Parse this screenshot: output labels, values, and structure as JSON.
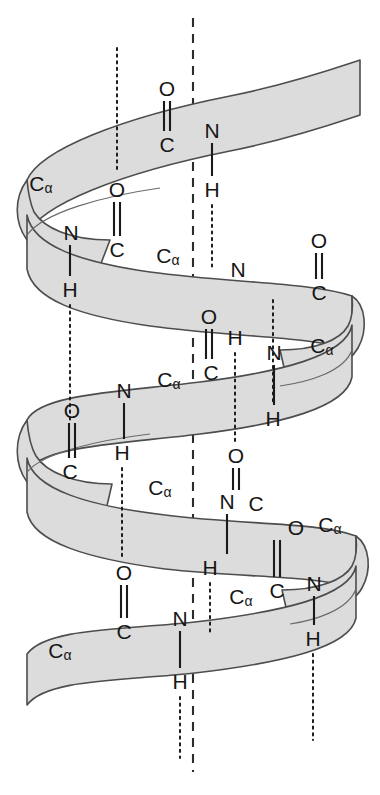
{
  "figure": {
    "width": 380,
    "height": 795,
    "background_color": "#ffffff",
    "ribbon_fill_color": "#dcdcdc",
    "ribbon_stroke_color": "#4d4d4d",
    "label_color": "#161616",
    "bond_line_color": "#1a1a1a",
    "axis_line_color": "#2b2b2b"
  },
  "atoms": [
    {
      "id": "a01",
      "text": "O",
      "sub": "",
      "x": 167,
      "y": 88
    },
    {
      "id": "a02",
      "text": "C",
      "sub": "",
      "x": 167,
      "y": 144
    },
    {
      "id": "a03",
      "text": "N",
      "sub": "",
      "x": 212,
      "y": 130
    },
    {
      "id": "a04",
      "text": "C",
      "sub": "α",
      "x": 41,
      "y": 183
    },
    {
      "id": "a05",
      "text": "O",
      "sub": "",
      "x": 117,
      "y": 189
    },
    {
      "id": "a06",
      "text": "H",
      "sub": "",
      "x": 212,
      "y": 189
    },
    {
      "id": "a07",
      "text": "N",
      "sub": "",
      "x": 71,
      "y": 232
    },
    {
      "id": "a08",
      "text": "C",
      "sub": "",
      "x": 117,
      "y": 249
    },
    {
      "id": "a09",
      "text": "C",
      "sub": "α",
      "x": 168,
      "y": 255
    },
    {
      "id": "a10",
      "text": "O",
      "sub": "",
      "x": 319,
      "y": 240
    },
    {
      "id": "a11",
      "text": "N",
      "sub": "",
      "x": 238,
      "y": 269
    },
    {
      "id": "a12",
      "text": "C",
      "sub": "",
      "x": 319,
      "y": 292
    },
    {
      "id": "a13",
      "text": "H",
      "sub": "",
      "x": 70,
      "y": 289
    },
    {
      "id": "a14",
      "text": "O",
      "sub": "",
      "x": 209,
      "y": 316
    },
    {
      "id": "a15",
      "text": "H",
      "sub": "",
      "x": 235,
      "y": 337
    },
    {
      "id": "a16",
      "text": "N",
      "sub": "",
      "x": 274,
      "y": 352
    },
    {
      "id": "a17",
      "text": "C",
      "sub": "α",
      "x": 322,
      "y": 345
    },
    {
      "id": "a18",
      "text": "C",
      "sub": "α",
      "x": 169,
      "y": 379
    },
    {
      "id": "a19",
      "text": "C",
      "sub": "",
      "x": 211,
      "y": 372
    },
    {
      "id": "a20",
      "text": "N",
      "sub": "",
      "x": 124,
      "y": 390
    },
    {
      "id": "a21",
      "text": "O",
      "sub": "",
      "x": 72,
      "y": 410
    },
    {
      "id": "a22",
      "text": "H",
      "sub": "",
      "x": 273,
      "y": 418
    },
    {
      "id": "a23",
      "text": "H",
      "sub": "",
      "x": 122,
      "y": 452
    },
    {
      "id": "a24",
      "text": "C",
      "sub": "",
      "x": 70,
      "y": 471
    },
    {
      "id": "a25",
      "text": "O",
      "sub": "",
      "x": 236,
      "y": 455
    },
    {
      "id": "a26",
      "text": "C",
      "sub": "α",
      "x": 160,
      "y": 487
    },
    {
      "id": "a27",
      "text": "N",
      "sub": "",
      "x": 227,
      "y": 501
    },
    {
      "id": "a28",
      "text": "C",
      "sub": "",
      "x": 256,
      "y": 503
    },
    {
      "id": "a29",
      "text": "O",
      "sub": "",
      "x": 296,
      "y": 527
    },
    {
      "id": "a30",
      "text": "C",
      "sub": "α",
      "x": 330,
      "y": 524
    },
    {
      "id": "a31",
      "text": "H",
      "sub": "",
      "x": 210,
      "y": 567
    },
    {
      "id": "a32",
      "text": "O",
      "sub": "",
      "x": 124,
      "y": 572
    },
    {
      "id": "a33",
      "text": "C",
      "sub": "α",
      "x": 241,
      "y": 596
    },
    {
      "id": "a34",
      "text": "C",
      "sub": "",
      "x": 277,
      "y": 590
    },
    {
      "id": "a35",
      "text": "N",
      "sub": "",
      "x": 314,
      "y": 583
    },
    {
      "id": "a36",
      "text": "C",
      "sub": "",
      "x": 124,
      "y": 631
    },
    {
      "id": "a37",
      "text": "N",
      "sub": "",
      "x": 180,
      "y": 618
    },
    {
      "id": "a38",
      "text": "C",
      "sub": "α",
      "x": 60,
      "y": 650
    },
    {
      "id": "a39",
      "text": "H",
      "sub": "",
      "x": 313,
      "y": 638
    },
    {
      "id": "a40",
      "text": "H",
      "sub": "",
      "x": 180,
      "y": 681
    }
  ],
  "axis": {
    "name": "helix-axis",
    "x": 193,
    "y_top": 18,
    "y_bottom": 772
  },
  "legend_notes": {
    "solid_bonds": "covalent bond lines (C=O double, N-H single)",
    "dotted_bonds": "hydrogen bonds shown as vertical dotted lines",
    "dashed_axis": "central helix axis"
  }
}
